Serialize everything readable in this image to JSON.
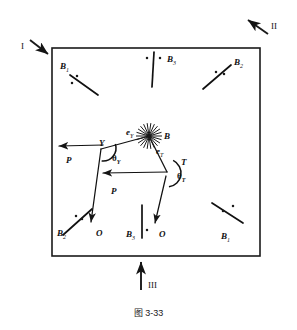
{
  "figure": {
    "caption": "图 3-33",
    "frame": {
      "x": 52,
      "y": 48,
      "width": 208,
      "height": 208,
      "stroke": "#1a1a1a",
      "stroke_width": 1.6
    },
    "colors": {
      "ink": "#1a1a1a",
      "line": "#111111"
    }
  },
  "direction_markers": [
    {
      "name": "marker-I",
      "label": "I",
      "label_x": 21,
      "label_y": 42,
      "arrow_from": [
        30,
        40
      ],
      "arrow_to": [
        48,
        54
      ]
    },
    {
      "name": "marker-II",
      "label": "II",
      "label_x": 271,
      "label_y": 22,
      "arrow_from": [
        268,
        34
      ],
      "arrow_to": [
        248,
        20
      ]
    },
    {
      "name": "marker-III",
      "label": "III",
      "label_x": 148,
      "label_y": 281,
      "arrow_from": [
        141,
        290
      ],
      "arrow_to": [
        141,
        262
      ]
    }
  ],
  "slip_traces": [
    {
      "name": "trace-B1-top-left",
      "label": "B",
      "subscript": "1",
      "label_x": 60,
      "label_y": 62,
      "x1": 70,
      "y1": 75,
      "x2": 98,
      "y2": 95,
      "dots": [
        [
          77,
          76
        ],
        [
          72,
          83
        ]
      ]
    },
    {
      "name": "trace-B3-top-center",
      "label": "B",
      "subscript": "3",
      "label_x": 167,
      "label_y": 55,
      "x1": 154,
      "y1": 52,
      "x2": 152,
      "y2": 87,
      "dots": [
        [
          147,
          58
        ],
        [
          160,
          58
        ]
      ]
    },
    {
      "name": "trace-B2-top-right",
      "label": "B",
      "subscript": "2",
      "label_x": 234,
      "label_y": 58,
      "x1": 203,
      "y1": 89,
      "x2": 231,
      "y2": 65,
      "dots": [
        [
          216,
          72
        ],
        [
          224,
          74
        ]
      ]
    },
    {
      "name": "trace-B2-bottom-left",
      "label": "B",
      "subscript": "2",
      "label_x": 57,
      "label_y": 229,
      "x1": 63,
      "y1": 235,
      "x2": 92,
      "y2": 209,
      "dots": [
        [
          76,
          216
        ],
        [
          82,
          219
        ]
      ]
    },
    {
      "name": "trace-B3-bottom-center",
      "label": "B",
      "subscript": "3",
      "label_x": 126,
      "label_y": 230,
      "x1": 142,
      "y1": 205,
      "x2": 142,
      "y2": 238,
      "dots": [
        [
          147,
          230
        ]
      ]
    },
    {
      "name": "trace-B1-bottom-right",
      "label": "B",
      "subscript": "1",
      "label_x": 221,
      "label_y": 232,
      "x1": 212,
      "y1": 203,
      "x2": 243,
      "y2": 223,
      "dots": [
        [
          233,
          206
        ],
        [
          223,
          211
        ]
      ]
    }
  ],
  "central": {
    "burst": {
      "name": "starburst-node-B",
      "cx": 149,
      "cy": 136,
      "rays": 11,
      "radius": 13
    },
    "label_B": {
      "text": "B",
      "x": 164,
      "y": 132
    },
    "label_eY": {
      "text": "e",
      "subscript": "Y",
      "x": 126,
      "y": 128
    },
    "label_eT": {
      "text": "e",
      "subscript": "T",
      "x": 156,
      "y": 147
    },
    "label_Y": {
      "text": "Y",
      "x": 99,
      "y": 139
    },
    "label_T": {
      "text": "T",
      "x": 181,
      "y": 158
    },
    "theta_Y": {
      "text": "θ",
      "subscript": "Y",
      "x": 112,
      "y": 154
    },
    "theta_T": {
      "text": "θ",
      "subscript": "T",
      "x": 177,
      "y": 172
    },
    "label_P_upper": {
      "text": "P",
      "x": 66,
      "y": 156
    },
    "label_P_lower": {
      "text": "P",
      "x": 111,
      "y": 187
    },
    "label_O_left": {
      "text": "O",
      "x": 96,
      "y": 229
    },
    "label_O_right": {
      "text": "O",
      "x": 159,
      "y": 230
    }
  },
  "vectors": [
    {
      "name": "vector-P-upper",
      "from": [
        103,
        145
      ],
      "to": [
        59,
        146
      ],
      "arrow": "end"
    },
    {
      "name": "vector-P-lower",
      "from": [
        167,
        172
      ],
      "to": [
        103,
        173
      ],
      "arrow": "end"
    },
    {
      "name": "vector-O-left",
      "from": [
        101,
        149
      ],
      "to": [
        91,
        222
      ],
      "arrow": "end"
    },
    {
      "name": "vector-O-right",
      "from": [
        166,
        176
      ],
      "to": [
        155,
        223
      ],
      "arrow": "end"
    },
    {
      "name": "edge-B-to-Y",
      "from": [
        149,
        136
      ],
      "to": [
        101,
        149
      ],
      "arrow": "none"
    },
    {
      "name": "edge-B-to-T",
      "from": [
        149,
        136
      ],
      "to": [
        167,
        172
      ],
      "arrow": "none"
    }
  ],
  "angle_arcs": [
    {
      "name": "arc-theta-Y",
      "cx": 103,
      "cy": 148,
      "r": 13,
      "start_deg": -18,
      "end_deg": 96
    },
    {
      "name": "arc-theta-T",
      "cx": 167,
      "cy": 173,
      "r": 14,
      "start_deg": -64,
      "end_deg": 82
    }
  ]
}
